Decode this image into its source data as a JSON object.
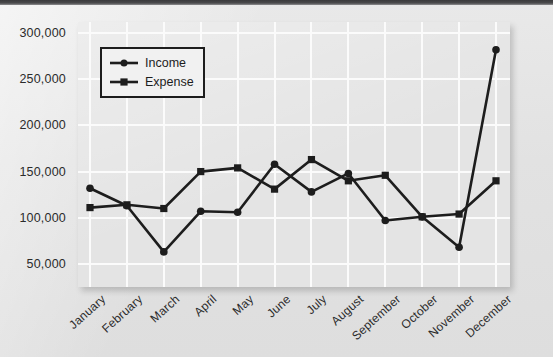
{
  "chart_data": {
    "type": "line",
    "title": "",
    "xlabel": "",
    "ylabel": "",
    "categories": [
      "January",
      "February",
      "March",
      "April",
      "May",
      "June",
      "July",
      "August",
      "September",
      "October",
      "November",
      "December"
    ],
    "series": [
      {
        "name": "Income",
        "marker": "circle",
        "color": "#1d1d1d",
        "values": [
          132000,
          113000,
          63000,
          107000,
          106000,
          158000,
          128000,
          148000,
          97000,
          101000,
          68000,
          282000
        ]
      },
      {
        "name": "Expense",
        "marker": "square",
        "color": "#1d1d1d",
        "values": [
          111000,
          114000,
          110000,
          150000,
          154000,
          131000,
          163000,
          140000,
          146000,
          101000,
          104000,
          140000
        ]
      }
    ],
    "ylim": [
      25000,
      312000
    ],
    "yticks": [
      50000,
      100000,
      150000,
      200000,
      250000,
      300000
    ],
    "ytick_labels": [
      "50,000",
      "100,000",
      "150,000",
      "200,000",
      "250,000",
      "300,000"
    ],
    "grid": true,
    "grid_color": "#fbfbfb",
    "plot_background": "#e4e4e4",
    "legend_position": "upper-left-inside"
  },
  "legend": {
    "entries": [
      {
        "label": "Income",
        "marker": "circle-marker-icon"
      },
      {
        "label": "Expense",
        "marker": "square-marker-icon"
      }
    ]
  }
}
